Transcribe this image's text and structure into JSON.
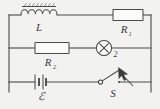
{
  "figure": {
    "kind": "circuit-diagram",
    "background_color": "#f2f2f0",
    "line_color": "#4a4a4a",
    "label_color": "#3a3a3a",
    "components": [
      {
        "id": "inductor",
        "symbol": "inductor-coil-with-core",
        "label": "L",
        "subscript": "",
        "branch": "top",
        "side": "left"
      },
      {
        "id": "resistor1",
        "symbol": "resistor-rectangle",
        "label": "R",
        "subscript": "1",
        "branch": "top",
        "side": "right"
      },
      {
        "id": "resistor2",
        "symbol": "resistor-rectangle",
        "label": "R",
        "subscript": "2",
        "branch": "middle",
        "side": "left"
      },
      {
        "id": "lamp",
        "symbol": "lamp-circle-x",
        "label": "",
        "subscript": "2",
        "branch": "middle",
        "side": "right"
      },
      {
        "id": "battery",
        "symbol": "battery-cell",
        "label": "ℰ",
        "subscript": "",
        "branch": "bottom",
        "side": "left"
      },
      {
        "id": "switch",
        "symbol": "switch-open",
        "label": "S",
        "subscript": "",
        "branch": "bottom",
        "side": "right"
      }
    ],
    "labels": {
      "inductor": "L",
      "resistor1_base": "R",
      "resistor1_sub": "1",
      "resistor2_base": "R",
      "resistor2_sub": "2",
      "lamp_number": "2",
      "battery": "ℰ",
      "switch": "S"
    },
    "annotation": {
      "pointer": "arrow-cursor",
      "points_at": "switch"
    }
  }
}
